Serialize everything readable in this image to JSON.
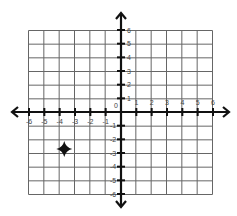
{
  "diagram": {
    "type": "coordinate-plane",
    "x_range": [
      -6,
      6
    ],
    "y_range": [
      -6,
      6
    ],
    "grid_step": 1,
    "origin_label": "0",
    "x_labels_positive": [
      "1",
      "2",
      "3",
      "4",
      "5",
      "6"
    ],
    "x_labels_negative": [
      "-6",
      "-5",
      "-4",
      "-3",
      "-2",
      "-1"
    ],
    "y_labels_positive": [
      "1",
      "2",
      "3",
      "4",
      "5",
      "6"
    ],
    "y_labels_negative": [
      "-1",
      "-2",
      "-3",
      "-4",
      "-5",
      "-6"
    ],
    "point": {
      "marker": "star-icon",
      "x": -3.7,
      "y": -2.7,
      "quadrant": "III"
    },
    "colors": {
      "grid": "#555555",
      "axis": "#111111",
      "label": "#444444",
      "marker": "#111111"
    }
  }
}
